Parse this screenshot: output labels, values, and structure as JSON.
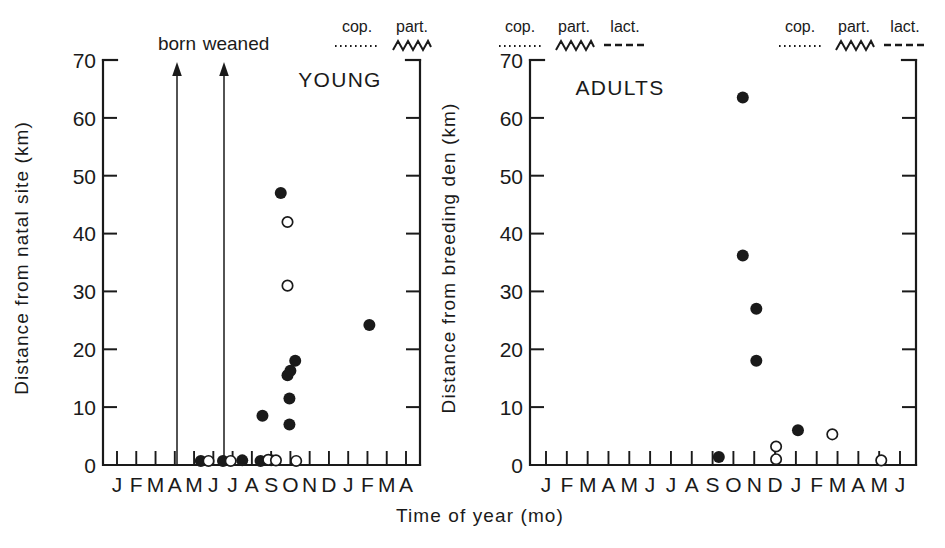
{
  "figure": {
    "xlabel": "Time of year (mo)"
  },
  "chart_data": [
    {
      "type": "scatter",
      "title": "YOUNG",
      "xlabel": "Time of year (mo)",
      "ylabel": "Distance from natal site (km)",
      "ylim": [
        0,
        70
      ],
      "yticks": [
        0,
        10,
        20,
        30,
        40,
        50,
        60,
        70
      ],
      "ytick_labels": [
        "0",
        "10",
        "20",
        "30",
        "40",
        "50",
        "60",
        "70"
      ],
      "xtick_labels": [
        "J",
        "F",
        "M",
        "A",
        "M",
        "J",
        "J",
        "A",
        "S",
        "O",
        "N",
        "D",
        "J",
        "F",
        "M",
        "A"
      ],
      "grid": false,
      "series": [
        {
          "name": "filled-circle",
          "marker": "filled",
          "points": [
            {
              "x": 5.35,
              "y": 0.7
            },
            {
              "x": 6.5,
              "y": 0.7
            },
            {
              "x": 7.5,
              "y": 0.8
            },
            {
              "x": 8.45,
              "y": 0.7
            },
            {
              "x": 9.0,
              "y": 0.8
            },
            {
              "x": 8.55,
              "y": 8.5
            },
            {
              "x": 9.5,
              "y": 47.0
            },
            {
              "x": 9.95,
              "y": 11.5
            },
            {
              "x": 9.85,
              "y": 15.5
            },
            {
              "x": 10.0,
              "y": 16.3
            },
            {
              "x": 10.25,
              "y": 18.0
            },
            {
              "x": 9.95,
              "y": 7.0
            },
            {
              "x": 14.1,
              "y": 24.2
            }
          ]
        },
        {
          "name": "open-circle",
          "marker": "open",
          "points": [
            {
              "x": 5.75,
              "y": 0.7
            },
            {
              "x": 6.9,
              "y": 0.7
            },
            {
              "x": 8.85,
              "y": 0.9
            },
            {
              "x": 9.25,
              "y": 0.8
            },
            {
              "x": 10.3,
              "y": 0.7
            },
            {
              "x": 9.85,
              "y": 42.0
            },
            {
              "x": 9.85,
              "y": 31.0
            }
          ]
        }
      ],
      "annotations": [
        {
          "label": "born",
          "x": 2.0,
          "type": "up-arrow",
          "from_y": 0,
          "to_y": 69
        },
        {
          "label": "weaned",
          "x": 4.3,
          "type": "up-arrow",
          "from_y": 0,
          "to_y": 69
        }
      ],
      "legends": [
        {
          "x_position": "right",
          "entries": [
            {
              "label": "cop.",
              "style": "dotted"
            },
            {
              "label": "part.",
              "style": "zigzag"
            }
          ]
        }
      ]
    },
    {
      "type": "scatter",
      "title": "ADULTS",
      "xlabel": "Time of year (mo)",
      "ylabel": "Distance from breeding den (km)",
      "ylim": [
        0,
        70
      ],
      "yticks": [
        0,
        10,
        20,
        30,
        40,
        50,
        60,
        70
      ],
      "ytick_labels": [
        "0",
        "10",
        "20",
        "30",
        "40",
        "50",
        "60",
        "70"
      ],
      "xtick_labels": [
        "J",
        "F",
        "M",
        "A",
        "M",
        "J",
        "J",
        "A",
        "S",
        "O",
        "N",
        "D",
        "J",
        "F",
        "M",
        "A",
        "M",
        "J"
      ],
      "grid": false,
      "series": [
        {
          "name": "filled-circle",
          "marker": "filled",
          "points": [
            {
              "x": 9.3,
              "y": 1.4
            },
            {
              "x": 10.45,
              "y": 63.5
            },
            {
              "x": 10.45,
              "y": 36.2
            },
            {
              "x": 11.1,
              "y": 27.0
            },
            {
              "x": 11.1,
              "y": 18.0
            },
            {
              "x": 13.1,
              "y": 6.0
            }
          ]
        },
        {
          "name": "open-circle",
          "marker": "open",
          "points": [
            {
              "x": 12.05,
              "y": 3.2
            },
            {
              "x": 12.05,
              "y": 1.0
            },
            {
              "x": 14.75,
              "y": 5.3
            },
            {
              "x": 17.1,
              "y": 0.8
            }
          ]
        }
      ],
      "legends": [
        {
          "x_position": "left",
          "entries": [
            {
              "label": "cop.",
              "style": "dotted"
            },
            {
              "label": "part.",
              "style": "zigzag"
            },
            {
              "label": "lact.",
              "style": "dashed"
            }
          ]
        },
        {
          "x_position": "right",
          "entries": [
            {
              "label": "cop.",
              "style": "dotted"
            },
            {
              "label": "part.",
              "style": "zigzag"
            },
            {
              "label": "lact.",
              "style": "dashed"
            }
          ]
        }
      ]
    }
  ]
}
